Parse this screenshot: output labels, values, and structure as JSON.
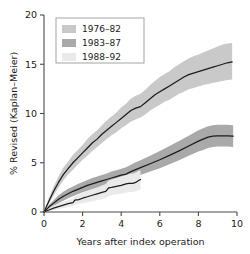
{
  "chart_data": {
    "type": "line",
    "title": "",
    "xlabel": "Years after index operation",
    "ylabel": "% Revised (Kaplan–Meier)",
    "xlim": [
      0,
      10
    ],
    "ylim": [
      0,
      20
    ],
    "xticks": [
      "0",
      "2",
      "4",
      "6",
      "8",
      "10"
    ],
    "xtick_values": [
      0,
      2,
      4,
      6,
      8,
      10
    ],
    "yticks": [
      "0",
      "5",
      "10",
      "15",
      "20"
    ],
    "ytick_values": [
      0,
      5,
      10,
      15,
      20
    ],
    "grid": false,
    "legend_position": "top-left",
    "band_type": "confidence-interval",
    "series": [
      {
        "name": "1976–82",
        "color": "#c9c9c9",
        "line_color": "#1c1c1c",
        "x": [
          0,
          0.25,
          0.5,
          0.75,
          1.0,
          1.25,
          1.5,
          1.75,
          2.0,
          2.25,
          2.5,
          2.75,
          3.0,
          3.25,
          3.5,
          3.75,
          4.0,
          4.25,
          4.5,
          4.75,
          5.0,
          5.25,
          5.5,
          5.75,
          6.0,
          6.25,
          6.5,
          6.75,
          7.0,
          7.25,
          7.5,
          7.75,
          8.0,
          8.25,
          8.5,
          8.75,
          9.0,
          9.25,
          9.5,
          9.75
        ],
        "values": [
          0,
          1.1,
          2.1,
          3.0,
          3.8,
          4.4,
          5.0,
          5.5,
          6.0,
          6.5,
          7.0,
          7.4,
          7.9,
          8.3,
          8.7,
          9.1,
          9.5,
          9.9,
          10.3,
          10.55,
          10.7,
          11.1,
          11.5,
          11.9,
          12.2,
          12.5,
          12.8,
          13.1,
          13.4,
          13.7,
          13.95,
          14.1,
          14.25,
          14.4,
          14.55,
          14.7,
          14.85,
          15.0,
          15.15,
          15.25
        ],
        "lower": [
          0,
          0.8,
          1.7,
          2.5,
          3.2,
          3.8,
          4.3,
          4.8,
          5.3,
          5.7,
          6.2,
          6.6,
          7.0,
          7.4,
          7.8,
          8.1,
          8.5,
          8.8,
          9.2,
          9.4,
          9.6,
          9.9,
          10.3,
          10.6,
          10.9,
          11.2,
          11.4,
          11.7,
          12.0,
          12.2,
          12.45,
          12.6,
          12.75,
          12.9,
          13.0,
          13.1,
          13.2,
          13.3,
          13.4,
          13.45
        ],
        "upper": [
          0,
          1.4,
          2.6,
          3.6,
          4.5,
          5.1,
          5.8,
          6.3,
          6.8,
          7.4,
          7.9,
          8.3,
          8.8,
          9.3,
          9.7,
          10.1,
          10.6,
          11.0,
          11.5,
          11.8,
          12.0,
          12.4,
          12.9,
          13.3,
          13.7,
          14.0,
          14.3,
          14.7,
          15.0,
          15.3,
          15.6,
          15.8,
          16.0,
          16.2,
          16.4,
          16.6,
          16.8,
          17.0,
          17.1,
          17.15
        ],
        "final_value": 15.25
      },
      {
        "name": "1983–87",
        "color": "#a9a9a9",
        "line_color": "#1c1c1c",
        "x": [
          0,
          0.25,
          0.5,
          0.75,
          1.0,
          1.25,
          1.5,
          1.75,
          2.0,
          2.25,
          2.5,
          2.75,
          3.0,
          3.25,
          3.5,
          3.75,
          4.0,
          4.25,
          4.5,
          4.75,
          5.0,
          5.5,
          6.0,
          6.5,
          7.0,
          7.5,
          8.0,
          8.25,
          8.5,
          8.75,
          9.0,
          9.5,
          9.8
        ],
        "values": [
          0,
          0.5,
          0.9,
          1.3,
          1.6,
          1.85,
          2.1,
          2.3,
          2.5,
          2.7,
          2.85,
          3.0,
          3.15,
          3.3,
          3.45,
          3.6,
          3.75,
          3.85,
          4.1,
          4.3,
          4.5,
          4.9,
          5.3,
          5.75,
          6.2,
          6.7,
          7.2,
          7.4,
          7.6,
          7.7,
          7.72,
          7.72,
          7.7
        ],
        "lower": [
          0,
          0.3,
          0.6,
          0.9,
          1.15,
          1.4,
          1.6,
          1.8,
          2.0,
          2.15,
          2.3,
          2.45,
          2.6,
          2.7,
          2.85,
          3.0,
          3.1,
          3.2,
          3.4,
          3.6,
          3.75,
          4.1,
          4.45,
          4.85,
          5.25,
          5.7,
          6.15,
          6.3,
          6.5,
          6.6,
          6.65,
          6.65,
          6.6
        ],
        "upper": [
          0,
          0.7,
          1.2,
          1.7,
          2.05,
          2.35,
          2.6,
          2.85,
          3.05,
          3.25,
          3.45,
          3.6,
          3.75,
          3.9,
          4.1,
          4.25,
          4.4,
          4.55,
          4.8,
          5.05,
          5.25,
          5.7,
          6.2,
          6.7,
          7.2,
          7.75,
          8.3,
          8.5,
          8.7,
          8.8,
          8.85,
          8.85,
          8.8
        ],
        "final_value": 7.7
      },
      {
        "name": "1988–92",
        "color": "#eaeaea",
        "line_color": "#1c1c1c",
        "x": [
          0,
          0.25,
          0.5,
          0.75,
          1.0,
          1.25,
          1.5,
          1.6,
          1.8,
          2.0,
          2.25,
          2.5,
          2.75,
          3.0,
          3.2,
          3.35,
          3.5,
          3.75,
          4.0,
          4.25,
          4.4,
          4.6,
          4.75,
          4.9,
          5.0
        ],
        "values": [
          0,
          0.2,
          0.4,
          0.55,
          0.7,
          0.85,
          0.95,
          1.2,
          1.25,
          1.4,
          1.55,
          1.7,
          1.85,
          2.0,
          2.1,
          2.45,
          2.5,
          2.6,
          2.7,
          2.85,
          2.9,
          2.9,
          3.0,
          3.2,
          3.3
        ],
        "lower": [
          0,
          0.05,
          0.2,
          0.3,
          0.4,
          0.5,
          0.6,
          0.7,
          0.8,
          0.9,
          1.0,
          1.1,
          1.2,
          1.3,
          1.4,
          1.6,
          1.7,
          1.8,
          1.85,
          1.95,
          2.0,
          2.05,
          2.1,
          2.2,
          2.3
        ],
        "upper": [
          0,
          0.4,
          0.65,
          0.85,
          1.05,
          1.2,
          1.35,
          1.6,
          1.75,
          1.95,
          2.1,
          2.3,
          2.5,
          2.7,
          2.85,
          3.2,
          3.3,
          3.45,
          3.6,
          3.75,
          3.85,
          3.9,
          4.0,
          4.15,
          4.25
        ],
        "final_value": 3.3
      }
    ]
  },
  "legend": {
    "items": [
      {
        "label": "1976–82",
        "swatch": "#c9c9c9"
      },
      {
        "label": "1983–87",
        "swatch": "#a9a9a9"
      },
      {
        "label": "1988–92",
        "swatch": "#eaeaea"
      }
    ]
  },
  "axes": {
    "x_title": "Years after index operation",
    "y_title": "% Revised (Kaplan–Meier)",
    "x_tick_labels": [
      "0",
      "2",
      "4",
      "6",
      "8",
      "10"
    ],
    "y_tick_labels": [
      "0",
      "5",
      "10",
      "15",
      "20"
    ]
  }
}
